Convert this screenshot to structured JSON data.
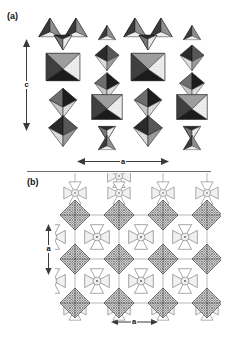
{
  "figure": {
    "panels": [
      {
        "id": "panel-a",
        "label": "(a)",
        "view": "polyhedral crystal structure projection along b axis",
        "axes": [
          {
            "name": "c-axis",
            "label": "c",
            "orientation": "vertical",
            "arrow": "double-headed"
          },
          {
            "name": "a-axis",
            "label": "a",
            "orientation": "horizontal",
            "arrow": "double-headed"
          }
        ]
      },
      {
        "id": "panel-b",
        "label": "(b)",
        "view": "plan projection showing octagonal channels",
        "axes": [
          {
            "name": "a-axis-vertical",
            "label": "a",
            "orientation": "vertical",
            "arrow": "double-headed"
          },
          {
            "name": "a-axis-horizontal",
            "label": "a",
            "orientation": "horizontal",
            "arrow": "double-headed"
          }
        ]
      }
    ],
    "colors": {
      "background": "#ffffff",
      "ink": "#111111",
      "divider": "#6e6e6e",
      "arrow": "#3a3a3a",
      "polyhedron_dark": "#1e1e1e",
      "polyhedron_mid": "#6b6b6b",
      "polyhedron_light": "#b8b8b8",
      "polyhedron_pale": "#e2e2e2",
      "hatch": "#5a5a5a",
      "outline": "#8a8a8a"
    }
  }
}
